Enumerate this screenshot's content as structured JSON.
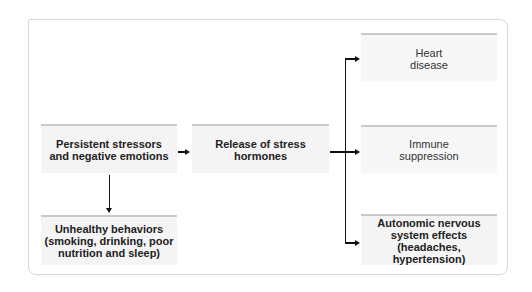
{
  "diagram": {
    "type": "flowchart",
    "nodes": {
      "stressors": {
        "line1": "Persistent stressors",
        "line2": "and negative emotions"
      },
      "hormones": {
        "line1": "Release of stress",
        "line2": "hormones"
      },
      "behaviors": {
        "line1": "Unhealthy behaviors",
        "line2": "(smoking, drinking, poor",
        "line3": "nutrition and sleep)"
      },
      "heart": {
        "line1": "Heart",
        "line2": "disease"
      },
      "immune": {
        "line1": "Immune",
        "line2": "suppression"
      },
      "autonomic": {
        "line1": "Autonomic nervous",
        "line2": "system effects",
        "line3": "(headaches, hypertension)"
      }
    },
    "edges": [
      {
        "from": "stressors",
        "to": "hormones"
      },
      {
        "from": "stressors",
        "to": "behaviors"
      },
      {
        "from": "hormones",
        "to": "heart"
      },
      {
        "from": "hormones",
        "to": "immune"
      },
      {
        "from": "hormones",
        "to": "autonomic"
      }
    ],
    "colors": {
      "box_fill": "#f4f4f4",
      "box_top_border": "#c9c9c9",
      "frame_border": "#d6d6d6",
      "arrow": "#111111"
    }
  }
}
